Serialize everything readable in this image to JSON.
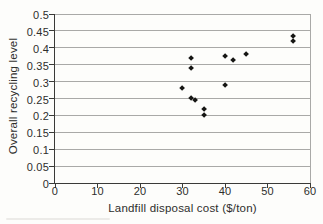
{
  "chart_data": {
    "type": "scatter",
    "title": "",
    "xlabel": "Landfill disposal cost ($/ton)",
    "ylabel": "Overall recycling level",
    "xlim": [
      0,
      60
    ],
    "ylim": [
      0,
      0.5
    ],
    "x_ticks": [
      0,
      10,
      20,
      30,
      40,
      50,
      60
    ],
    "x_tick_labels": [
      "0",
      "10",
      "20",
      "30",
      "40",
      "50",
      "60"
    ],
    "y_ticks": [
      0,
      0.05,
      0.1,
      0.15,
      0.2,
      0.25,
      0.3,
      0.35,
      0.4,
      0.45,
      0.5
    ],
    "y_tick_labels": [
      "0",
      "0.05",
      "0.1",
      "0.15",
      "0.2",
      "0.25",
      "0.3",
      "0.35",
      "0.4",
      "0.45",
      "0.5"
    ],
    "grid": "horizontal-only",
    "legend": "none",
    "marker": "diamond",
    "points": [
      {
        "x": 30,
        "y": 0.28
      },
      {
        "x": 32,
        "y": 0.37
      },
      {
        "x": 32,
        "y": 0.34
      },
      {
        "x": 32,
        "y": 0.25
      },
      {
        "x": 33,
        "y": 0.245
      },
      {
        "x": 35,
        "y": 0.22
      },
      {
        "x": 35,
        "y": 0.2
      },
      {
        "x": 40,
        "y": 0.375
      },
      {
        "x": 40,
        "y": 0.29
      },
      {
        "x": 42,
        "y": 0.365
      },
      {
        "x": 45,
        "y": 0.38
      },
      {
        "x": 56,
        "y": 0.435
      },
      {
        "x": 56,
        "y": 0.42
      }
    ],
    "colors": {
      "background": "#fdfdfb",
      "gridline": "#a9a9a7",
      "axis": "#3a3a38",
      "text": "#2e2e2c",
      "marker": "#161614"
    }
  }
}
